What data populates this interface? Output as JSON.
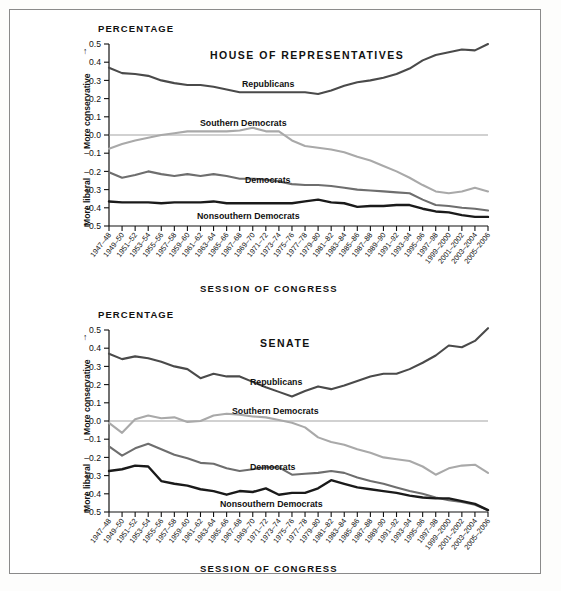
{
  "figure": {
    "background_color": "#ffffff",
    "frame_color": "#8a8a8a"
  },
  "common": {
    "y_axis_title": "PERCENTAGE",
    "x_axis_title": "SESSION OF CONGRESS",
    "up_label": "More conservative",
    "down_label": "More liberal",
    "up_arrow": "↑",
    "down_arrow": "↓",
    "y_ticks": [
      "0.5",
      "0.4",
      "0.3",
      "0.2",
      "0.1",
      "0.0",
      "–0.1",
      "–0.2",
      "–0.3",
      "–0.4",
      "–0.5"
    ],
    "categories": [
      "1947–48",
      "1949–50",
      "1951–52",
      "1953–54",
      "1955–56",
      "1957–58",
      "1959–60",
      "1961–62",
      "1963–64",
      "1965–66",
      "1967–68",
      "1969–70",
      "1971–72",
      "1973–74",
      "1975–76",
      "1977–78",
      "1979–80",
      "1981–82",
      "1983–84",
      "1985–86",
      "1987–88",
      "1989–90",
      "1991–92",
      "1993–94",
      "1995–96",
      "1997–98",
      "1999–2000",
      "2001–2002",
      "2003–2004",
      "2005–2006"
    ],
    "series_colors": {
      "republicans": "#4a4a4a",
      "southern_democrats": "#a9a9a9",
      "democrats": "#6e6e6e",
      "nonsouthern_democrats": "#1a1a1a"
    }
  },
  "house": {
    "title": "HOUSE OF REPRESENTATIVES",
    "labels": {
      "republicans": "Republicans",
      "southern_democrats": "Southern Democrats",
      "democrats": "Democrats",
      "nonsouthern_democrats": "Nonsouthern Democrats"
    }
  },
  "senate": {
    "title": "SENATE",
    "labels": {
      "republicans": "Republicans",
      "southern_democrats": "Southern Democrats",
      "democrats": "Democrats",
      "nonsouthern_democrats": "Nonsouthern Democrats"
    }
  },
  "chart_data": [
    {
      "type": "line",
      "title": "HOUSE OF REPRESENTATIVES",
      "xlabel": "SESSION OF CONGRESS",
      "ylabel": "PERCENTAGE",
      "ylim": [
        -0.5,
        0.5
      ],
      "grid": false,
      "legend": "inline-annotations",
      "categories": [
        "1947–48",
        "1949–50",
        "1951–52",
        "1953–54",
        "1955–56",
        "1957–58",
        "1959–60",
        "1961–62",
        "1963–64",
        "1965–66",
        "1967–68",
        "1969–70",
        "1971–72",
        "1973–74",
        "1975–76",
        "1977–78",
        "1979–80",
        "1981–82",
        "1983–84",
        "1985–86",
        "1987–88",
        "1989–90",
        "1991–92",
        "1993–94",
        "1995–96",
        "1997–98",
        "1999–2000",
        "2001–2002",
        "2003–2004",
        "2005–2006"
      ],
      "series": [
        {
          "name": "Republicans",
          "color": "#4a4a4a",
          "values": [
            0.37,
            0.34,
            0.335,
            0.325,
            0.3,
            0.285,
            0.275,
            0.275,
            0.265,
            0.25,
            0.235,
            0.235,
            0.235,
            0.235,
            0.235,
            0.235,
            0.225,
            0.245,
            0.27,
            0.29,
            0.3,
            0.315,
            0.335,
            0.365,
            0.41,
            0.44,
            0.455,
            0.47,
            0.465,
            0.5
          ]
        },
        {
          "name": "Southern Democrats",
          "color": "#a9a9a9",
          "values": [
            -0.075,
            -0.05,
            -0.03,
            -0.015,
            0.0,
            0.01,
            0.02,
            0.02,
            0.02,
            0.02,
            0.025,
            0.04,
            0.02,
            0.02,
            -0.03,
            -0.06,
            -0.07,
            -0.08,
            -0.095,
            -0.12,
            -0.14,
            -0.17,
            -0.2,
            -0.235,
            -0.275,
            -0.31,
            -0.32,
            -0.31,
            -0.29,
            -0.31
          ]
        },
        {
          "name": "Democrats",
          "color": "#6e6e6e",
          "values": [
            -0.205,
            -0.235,
            -0.22,
            -0.2,
            -0.215,
            -0.225,
            -0.215,
            -0.225,
            -0.215,
            -0.225,
            -0.24,
            -0.24,
            -0.245,
            -0.255,
            -0.27,
            -0.275,
            -0.275,
            -0.28,
            -0.29,
            -0.3,
            -0.305,
            -0.31,
            -0.315,
            -0.32,
            -0.355,
            -0.385,
            -0.39,
            -0.4,
            -0.405,
            -0.415
          ]
        },
        {
          "name": "Nonsouthern Democrats",
          "color": "#1a1a1a",
          "values": [
            -0.365,
            -0.37,
            -0.37,
            -0.37,
            -0.375,
            -0.37,
            -0.37,
            -0.37,
            -0.365,
            -0.375,
            -0.375,
            -0.375,
            -0.375,
            -0.375,
            -0.375,
            -0.365,
            -0.355,
            -0.37,
            -0.375,
            -0.395,
            -0.39,
            -0.39,
            -0.385,
            -0.385,
            -0.405,
            -0.42,
            -0.425,
            -0.44,
            -0.45,
            -0.45
          ]
        }
      ]
    },
    {
      "type": "line",
      "title": "SENATE",
      "xlabel": "SESSION OF CONGRESS",
      "ylabel": "PERCENTAGE",
      "ylim": [
        -0.5,
        0.5
      ],
      "grid": false,
      "legend": "inline-annotations",
      "categories": [
        "1947–48",
        "1949–50",
        "1951–52",
        "1953–54",
        "1955–56",
        "1957–58",
        "1959–60",
        "1961–62",
        "1963–64",
        "1965–66",
        "1967–68",
        "1969–70",
        "1971–72",
        "1973–74",
        "1975–76",
        "1977–78",
        "1979–80",
        "1981–82",
        "1983–84",
        "1985–86",
        "1987–88",
        "1989–90",
        "1991–92",
        "1993–94",
        "1995–96",
        "1997–98",
        "1999–2000",
        "2001–2002",
        "2003–2004",
        "2005–2006"
      ],
      "series": [
        {
          "name": "Republicans",
          "color": "#4a4a4a",
          "values": [
            0.37,
            0.34,
            0.355,
            0.345,
            0.325,
            0.3,
            0.285,
            0.235,
            0.26,
            0.245,
            0.245,
            0.215,
            0.185,
            0.16,
            0.135,
            0.165,
            0.19,
            0.175,
            0.195,
            0.22,
            0.245,
            0.26,
            0.26,
            0.285,
            0.32,
            0.36,
            0.415,
            0.405,
            0.44,
            0.51
          ]
        },
        {
          "name": "Southern Democrats",
          "color": "#a9a9a9",
          "values": [
            -0.01,
            -0.065,
            0.01,
            0.03,
            0.015,
            0.02,
            -0.005,
            0.0,
            0.03,
            0.04,
            0.035,
            0.025,
            0.02,
            0.005,
            -0.01,
            -0.035,
            -0.09,
            -0.115,
            -0.13,
            -0.155,
            -0.175,
            -0.2,
            -0.21,
            -0.22,
            -0.25,
            -0.295,
            -0.26,
            -0.245,
            -0.24,
            -0.285
          ]
        },
        {
          "name": "Democrats",
          "color": "#6e6e6e",
          "values": [
            -0.14,
            -0.19,
            -0.15,
            -0.125,
            -0.155,
            -0.185,
            -0.205,
            -0.23,
            -0.235,
            -0.26,
            -0.275,
            -0.265,
            -0.255,
            -0.255,
            -0.295,
            -0.29,
            -0.285,
            -0.275,
            -0.285,
            -0.31,
            -0.33,
            -0.345,
            -0.365,
            -0.385,
            -0.4,
            -0.42,
            -0.435,
            -0.445,
            -0.46,
            -0.49
          ]
        },
        {
          "name": "Nonsouthern Democrats",
          "color": "#1a1a1a",
          "values": [
            -0.275,
            -0.265,
            -0.245,
            -0.25,
            -0.33,
            -0.345,
            -0.355,
            -0.375,
            -0.385,
            -0.405,
            -0.385,
            -0.39,
            -0.37,
            -0.405,
            -0.395,
            -0.395,
            -0.37,
            -0.325,
            -0.345,
            -0.365,
            -0.375,
            -0.385,
            -0.395,
            -0.41,
            -0.42,
            -0.425,
            -0.425,
            -0.44,
            -0.455,
            -0.49
          ]
        }
      ]
    }
  ]
}
